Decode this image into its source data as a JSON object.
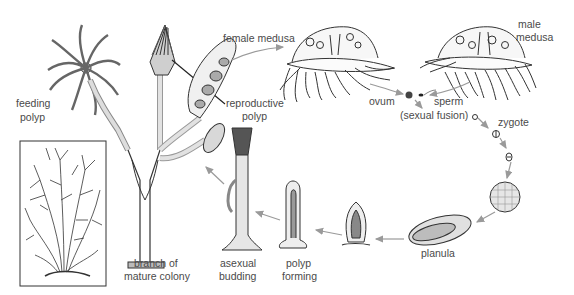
{
  "diagram": {
    "stroke_color": "#2a2a2a",
    "arrow_color": "#9a9a9a",
    "label_color": "#4a4a4a",
    "labels": {
      "feeding_polyp_1": "feeding",
      "feeding_polyp_2": "polyp",
      "reproductive_polyp_1": "reproductive",
      "reproductive_polyp_2": "polyp",
      "female_medusa": "female medusa",
      "male_medusa_1": "male",
      "male_medusa_2": "medusa",
      "ovum": "ovum",
      "sperm": "sperm",
      "sexual_fusion": "(sexual fusion)",
      "zygote": "zygote",
      "planula": "planula",
      "polyp_forming_1": "polyp",
      "polyp_forming_2": "forming",
      "asexual_budding_1": "asexual",
      "asexual_budding_2": "budding",
      "branch_1": "branch of",
      "branch_2": "mature colony"
    },
    "stages": [
      "branch of mature colony",
      "female medusa",
      "male medusa",
      "ovum",
      "sperm",
      "zygote",
      "blastula",
      "planula",
      "settling larva",
      "polyp forming",
      "asexual budding"
    ]
  }
}
